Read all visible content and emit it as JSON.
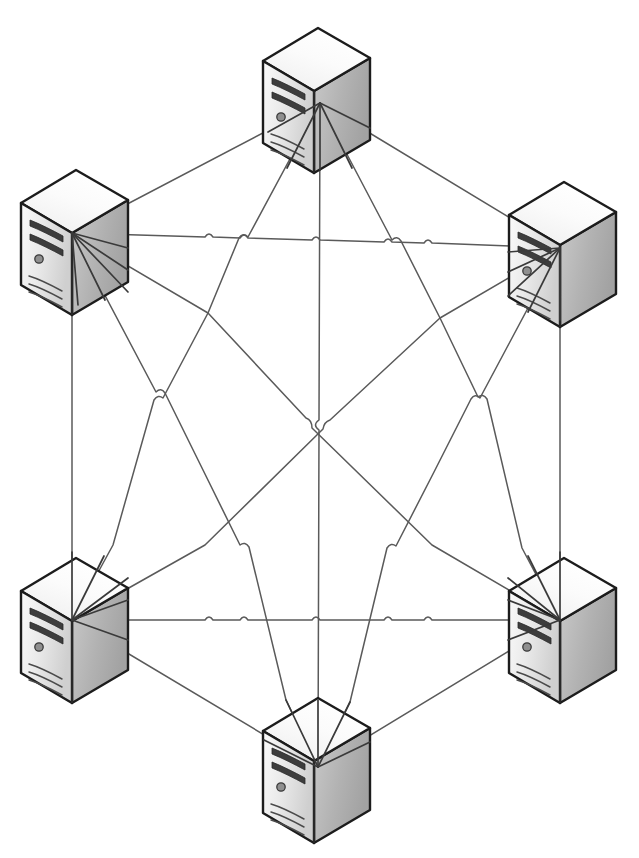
{
  "diagram": {
    "type": "network-topology",
    "topology": "full-mesh",
    "node_count": 6,
    "edge_count": 15,
    "background_color": "#ffffff",
    "line_color": "#5a5a5a",
    "outline_color": "#1c1c1c",
    "front_face_color": "#e8e8e8",
    "top_face_color": "#f7f7f7",
    "side_face_color": "#b4b4b4",
    "crossing_style": "line-hop"
  },
  "nodes": [
    {
      "id": "srv-top",
      "label": "Server Top",
      "icon": "server-tower-icon",
      "x": 320,
      "y": 103,
      "body_x": 262,
      "body_y": 18
    },
    {
      "id": "srv-top-left",
      "label": "Server Top Left",
      "icon": "server-tower-icon",
      "x": 72,
      "y": 233,
      "body_x": 20,
      "body_y": 160
    },
    {
      "id": "srv-top-right",
      "label": "Server Top Right",
      "icon": "server-tower-icon",
      "x": 560,
      "y": 248,
      "body_x": 508,
      "body_y": 172
    },
    {
      "id": "srv-bottom-left",
      "label": "Server Bottom Left",
      "icon": "server-tower-icon",
      "x": 72,
      "y": 620,
      "body_x": 20,
      "body_y": 548
    },
    {
      "id": "srv-bottom-right",
      "label": "Server Bottom Right",
      "icon": "server-tower-icon",
      "x": 560,
      "y": 620,
      "body_x": 508,
      "body_y": 548
    },
    {
      "id": "srv-bottom",
      "label": "Server Bottom",
      "icon": "server-tower-icon",
      "x": 318,
      "y": 767,
      "body_x": 262,
      "body_y": 688
    }
  ],
  "edges": [
    {
      "id": "e1",
      "from": "srv-top",
      "to": "srv-top-left"
    },
    {
      "id": "e2",
      "from": "srv-top",
      "to": "srv-top-right"
    },
    {
      "id": "e3",
      "from": "srv-top",
      "to": "srv-bottom-left"
    },
    {
      "id": "e4",
      "from": "srv-top",
      "to": "srv-bottom-right"
    },
    {
      "id": "e5",
      "from": "srv-top",
      "to": "srv-bottom"
    },
    {
      "id": "e6",
      "from": "srv-top-left",
      "to": "srv-top-right"
    },
    {
      "id": "e7",
      "from": "srv-top-left",
      "to": "srv-bottom-left"
    },
    {
      "id": "e8",
      "from": "srv-top-left",
      "to": "srv-bottom-right"
    },
    {
      "id": "e9",
      "from": "srv-top-left",
      "to": "srv-bottom"
    },
    {
      "id": "e10",
      "from": "srv-top-right",
      "to": "srv-bottom-left"
    },
    {
      "id": "e11",
      "from": "srv-top-right",
      "to": "srv-bottom-right"
    },
    {
      "id": "e12",
      "from": "srv-top-right",
      "to": "srv-bottom"
    },
    {
      "id": "e13",
      "from": "srv-bottom-left",
      "to": "srv-bottom-right"
    },
    {
      "id": "e14",
      "from": "srv-bottom-left",
      "to": "srv-bottom"
    },
    {
      "id": "e15",
      "from": "srv-bottom-right",
      "to": "srv-bottom"
    }
  ]
}
